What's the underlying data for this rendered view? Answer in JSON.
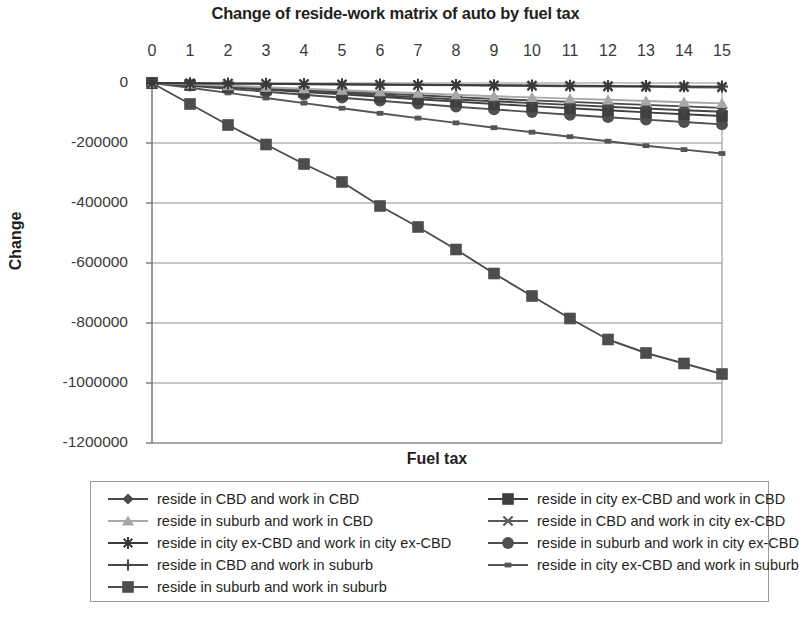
{
  "chart_data": {
    "type": "line",
    "title": "Change of reside-work matrix of auto by fuel tax",
    "xlabel": "Fuel tax",
    "ylabel": "Change",
    "x": [
      0,
      1,
      2,
      3,
      4,
      5,
      6,
      7,
      8,
      9,
      10,
      11,
      12,
      13,
      14,
      15
    ],
    "xlim": [
      0,
      15
    ],
    "ylim": [
      -1200000,
      0
    ],
    "yticks": [
      0,
      -200000,
      -400000,
      -600000,
      -800000,
      -1000000,
      -1200000
    ],
    "ytick_labels": [
      "0",
      "-200000",
      "-400000",
      "-600000",
      "-800000",
      "-1000000",
      "-1200000"
    ],
    "xtick_labels": [
      "0",
      "1",
      "2",
      "3",
      "4",
      "5",
      "6",
      "7",
      "8",
      "9",
      "10",
      "11",
      "12",
      "13",
      "14",
      "15"
    ],
    "grid": "horizontal",
    "legend_position": "bottom",
    "series": [
      {
        "name": "reside in CBD and work in CBD",
        "marker": "diamond",
        "color": "#4a4a4a",
        "values": [
          0,
          -5000,
          -11000,
          -17000,
          -23000,
          -29000,
          -35000,
          -41000,
          -47000,
          -53000,
          -58000,
          -63000,
          -68000,
          -73000,
          -78000,
          -83000
        ]
      },
      {
        "name": "reside in city ex-CBD and work in CBD",
        "marker": "square",
        "color": "#3f3f3f",
        "values": [
          0,
          -7000,
          -14000,
          -22000,
          -30000,
          -38000,
          -46000,
          -54000,
          -62000,
          -70000,
          -77000,
          -84000,
          -91000,
          -98000,
          -104000,
          -110000
        ]
      },
      {
        "name": "reside in suburb and work in CBD",
        "marker": "triangle",
        "color": "#a8a8a8",
        "values": [
          0,
          -4000,
          -9000,
          -14000,
          -19000,
          -24000,
          -29000,
          -34000,
          -39000,
          -44000,
          -48000,
          -52000,
          -56000,
          -60000,
          -64000,
          -68000
        ]
      },
      {
        "name": "reside in CBD and work in city ex-CBD",
        "marker": "cross-x",
        "color": "#5a5a5a",
        "values": [
          0,
          -1000,
          -2000,
          -3000,
          -4000,
          -5000,
          -6000,
          -7000,
          -8000,
          -9000,
          -10000,
          -11000,
          -12000,
          -13000,
          -14000,
          -15000
        ]
      },
      {
        "name": "reside in city ex-CBD and work in city ex-CBD",
        "marker": "asterisk",
        "color": "#3a3a3a",
        "values": [
          0,
          -800,
          -1600,
          -2400,
          -3200,
          -4000,
          -4800,
          -5600,
          -6400,
          -7200,
          -8000,
          -8800,
          -9600,
          -10400,
          -11200,
          -12000
        ]
      },
      {
        "name": "reside in suburb and work in city ex-CBD",
        "marker": "circle",
        "color": "#4f4f4f",
        "values": [
          0,
          -9000,
          -19000,
          -29000,
          -39000,
          -49000,
          -59000,
          -69000,
          -79000,
          -88000,
          -97000,
          -106000,
          -114000,
          -122000,
          -130000,
          -138000
        ]
      },
      {
        "name": "reside in CBD and work in suburb",
        "marker": "plus",
        "color": "#464646",
        "values": [
          0,
          -6000,
          -13000,
          -20000,
          -27000,
          -34000,
          -41000,
          -48000,
          -55000,
          -61000,
          -67000,
          -73000,
          -79000,
          -85000,
          -91000,
          -96000
        ]
      },
      {
        "name": "reside in city ex-CBD and work in suburb",
        "marker": "small-square",
        "color": "#555555",
        "values": [
          0,
          -16000,
          -33000,
          -50000,
          -67000,
          -84000,
          -101000,
          -117000,
          -133000,
          -149000,
          -164000,
          -179000,
          -194000,
          -209000,
          -222000,
          -235000
        ]
      },
      {
        "name": "reside in suburb and work in suburb",
        "marker": "square",
        "color": "#4d4d4d",
        "values": [
          0,
          -70000,
          -140000,
          -205000,
          -270000,
          -330000,
          -410000,
          -480000,
          -555000,
          -635000,
          -710000,
          -785000,
          -855000,
          -900000,
          -935000,
          -970000
        ]
      }
    ]
  },
  "legend": {
    "rows": [
      {
        "left": {
          "label": "reside in CBD and work in CBD",
          "series_index": 0
        },
        "right": {
          "label": "reside in city ex-CBD and work in CBD",
          "series_index": 1
        }
      },
      {
        "left": {
          "label": "reside in suburb and work in CBD",
          "series_index": 2
        },
        "right": {
          "label": "reside in CBD and work in city ex-CBD",
          "series_index": 3
        }
      },
      {
        "left": {
          "label": "reside in city ex-CBD and work in city ex-CBD",
          "series_index": 4
        },
        "right": {
          "label": "reside in suburb and work in city ex-CBD",
          "series_index": 5
        }
      },
      {
        "left": {
          "label": "reside in CBD and work in suburb",
          "series_index": 6
        },
        "right": {
          "label": "reside in city ex-CBD and work in suburb",
          "series_index": 7
        }
      },
      {
        "left": {
          "label": "reside in suburb and work in suburb",
          "series_index": 8
        },
        "right": null
      }
    ]
  }
}
